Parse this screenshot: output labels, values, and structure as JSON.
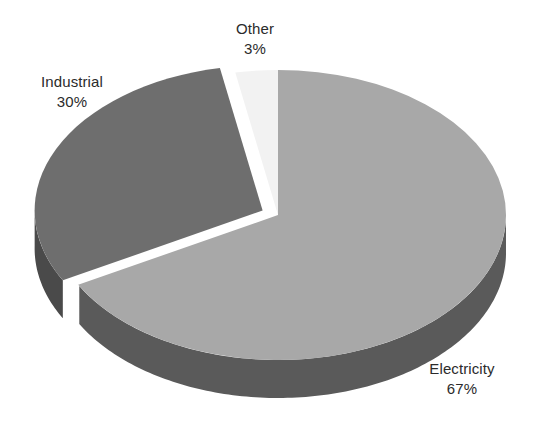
{
  "chart_data": {
    "type": "pie",
    "title": "",
    "subtitle": "",
    "xlabel": "",
    "ylabel": "",
    "legend_position": "none",
    "grid": false,
    "style": "3d-exploded-pie",
    "background_color": "#ffffff",
    "label_text_color": "#2b2b2b",
    "categories": [
      "Electricity",
      "Industrial",
      "Other"
    ],
    "values": [
      67,
      30,
      3
    ],
    "value_suffix": "%",
    "slices": [
      {
        "label": "Electricity",
        "value": 67,
        "value_text": "67%",
        "top_color": "#a8a8a8",
        "side_color": "#5a5a5a",
        "label_position": "bottom-right"
      },
      {
        "label": "Industrial",
        "value": 30,
        "value_text": "30%",
        "top_color": "#6e6e6e",
        "side_color": "#4a4a4a",
        "label_position": "top-left",
        "exploded": true
      },
      {
        "label": "Other",
        "value": 3,
        "value_text": "3%",
        "top_color": "#f2f2f2",
        "side_color": "#cfcfcf",
        "label_position": "top-center"
      }
    ]
  },
  "labels": {
    "other": {
      "name": "Other",
      "value": "3%"
    },
    "industrial": {
      "name": "Industrial",
      "value": "30%"
    },
    "electricity": {
      "name": "Electricity",
      "value": "67%"
    }
  }
}
